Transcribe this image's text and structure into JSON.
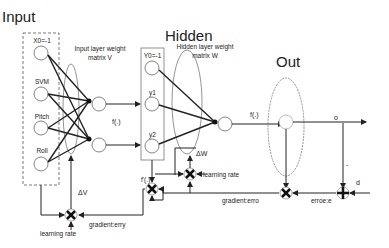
{
  "titles": {
    "input": "Input",
    "hidden": "Hidden",
    "out": "Out"
  },
  "input_nodes": [
    {
      "label": "X0=-1"
    },
    {
      "label": "SVM"
    },
    {
      "label": "Pitch"
    },
    {
      "label": "Roll"
    }
  ],
  "hidden_nodes": [
    {
      "label": "Y0=-1"
    },
    {
      "label": "y1"
    },
    {
      "label": "y2"
    }
  ],
  "weights": {
    "input_matrix_line1": "Input layer weight",
    "input_matrix_line2": "matrix V",
    "hidden_matrix_line1": "Hidden layer weight",
    "hidden_matrix_line2": "matrix W"
  },
  "activation": {
    "f1": "f(.)",
    "f2": "f(.)",
    "f_prime": "f'(.)"
  },
  "signals": {
    "output": "o",
    "desired": "d",
    "minus_sign": "-",
    "delta_v": "ΔV",
    "delta_w": "ΔW",
    "learning_rate_hidden": "learning rate",
    "learning_rate_input": "learning rate",
    "gradient_erro": "gradient:erro",
    "gradient_erry": "gradient:erry",
    "error": "erroe:e"
  }
}
